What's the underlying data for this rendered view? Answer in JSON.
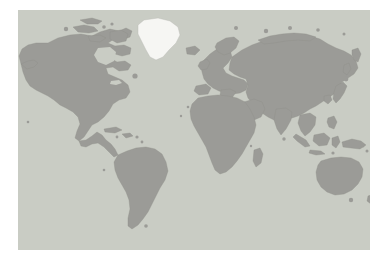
{
  "page": {
    "background_color": "#ffffff",
    "width": 387,
    "height": 265
  },
  "map": {
    "title": "World Map",
    "projection": "equirectangular",
    "ocean_color": "#c9ccc4",
    "land_color": "#9b9b97",
    "land_border_color": "#8d8d89",
    "highlight_color": "#f6f6f3",
    "panel": {
      "left": 18,
      "top": 10,
      "width": 352,
      "height": 240
    },
    "legend": {
      "highlighted_label": "Greenland",
      "default_label": "Other regions"
    },
    "regions": [
      {
        "name": "Greenland",
        "highlighted": true,
        "fill": "#f6f6f3"
      },
      {
        "name": "North America",
        "highlighted": false,
        "fill": "#9b9b97"
      },
      {
        "name": "South America",
        "highlighted": false,
        "fill": "#9b9b97"
      },
      {
        "name": "Europe",
        "highlighted": false,
        "fill": "#9b9b97"
      },
      {
        "name": "Africa",
        "highlighted": false,
        "fill": "#9b9b97"
      },
      {
        "name": "Asia",
        "highlighted": false,
        "fill": "#9b9b97"
      },
      {
        "name": "Australia",
        "highlighted": false,
        "fill": "#9b9b97"
      },
      {
        "name": "Antarctica",
        "highlighted": false,
        "fill": "#9b9b97"
      }
    ]
  }
}
